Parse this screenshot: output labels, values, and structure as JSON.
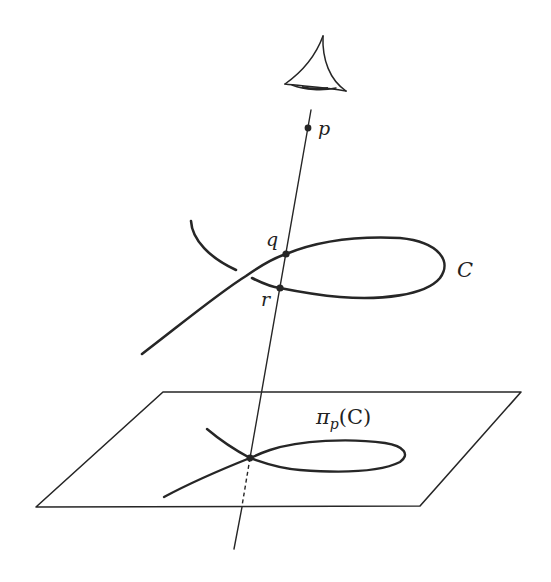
{
  "figure": {
    "labels": {
      "point_p": "p",
      "point_q": "q",
      "point_r": "r",
      "curve": "C",
      "projection": "π",
      "projection_sub": "p",
      "projection_arg": "(C)"
    },
    "elements": {
      "eye": "eye-icon viewpoint above p",
      "line": "line through p, q, r meeting the plane at the node of the projected curve",
      "plane": "parallelogram plane",
      "curve": "space curve C with a loop",
      "projected_curve": "nodal plane curve π_p(C)"
    },
    "colors": {
      "ink": "#262626",
      "background": "#ffffff"
    }
  },
  "bleed_through_text": [
    "ng V and U",
    "s the ...",
    "the plane, they",
    "..."
  ]
}
